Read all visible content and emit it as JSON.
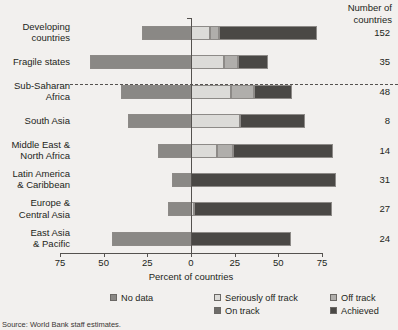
{
  "header": {
    "count_column_title_line1": "Number of",
    "count_column_title_line2": "countries"
  },
  "axis": {
    "x_title": "Percent of countries",
    "ticks": [
      {
        "label": "75",
        "value": -75
      },
      {
        "label": "50",
        "value": -50
      },
      {
        "label": "25",
        "value": -25
      },
      {
        "label": "0",
        "value": 0
      },
      {
        "label": "25",
        "value": 25
      },
      {
        "label": "50",
        "value": 50
      },
      {
        "label": "75",
        "value": 75
      }
    ]
  },
  "legend": {
    "items": [
      {
        "label": "No data",
        "color": "#8a8885"
      },
      {
        "label": "Seriously off track",
        "color": "#dcdbd8"
      },
      {
        "label": "Off track",
        "color": "#b0aeab"
      },
      {
        "label": "On track",
        "color": "#6e6c69"
      },
      {
        "label": "Achieved",
        "color": "#4a4845"
      }
    ]
  },
  "source": {
    "text": "Source: World Bank staff estimates."
  },
  "chart_data": {
    "type": "bar",
    "orientation": "horizontal",
    "stacked": true,
    "diverging": true,
    "title": "",
    "xlabel": "Percent of countries",
    "ylabel": "",
    "xlim": [
      -75,
      75
    ],
    "xticks": [
      -75,
      -50,
      -25,
      0,
      25,
      50,
      75
    ],
    "xticklabels": [
      "75",
      "50",
      "25",
      "0",
      "25",
      "50",
      "75"
    ],
    "grid": false,
    "legend_position": "bottom",
    "series_names": [
      "No data",
      "Seriously off track",
      "Off track",
      "On track",
      "Achieved"
    ],
    "series_colors": [
      "#8a8885",
      "#dcdbd8",
      "#b0aeab",
      "#6e6c69",
      "#4a4845"
    ],
    "annotations": {
      "count_column_header": "Number of countries",
      "dashed_separator_after": "Fragile states"
    },
    "categories": [
      "Developing countries",
      "Fragile states",
      "Sub-Saharan Africa",
      "South Asia",
      "Middle East & North Africa",
      "Latin America & Caribbean",
      "Europe & Central Asia",
      "East Asia & Pacific"
    ],
    "counts": [
      152,
      35,
      48,
      8,
      14,
      31,
      27,
      24
    ],
    "series": [
      {
        "name": "No data",
        "values": [
          -28,
          -58,
          -40,
          -36,
          -19,
          -11,
          -13,
          -45
        ]
      },
      {
        "name": "Seriously off track",
        "values": [
          11,
          19,
          23,
          28,
          15,
          0,
          2,
          0
        ]
      },
      {
        "name": "Off track",
        "values": [
          5,
          8,
          13,
          0,
          9,
          0,
          0,
          0
        ]
      },
      {
        "name": "On track",
        "values": [
          0,
          0,
          0,
          0,
          0,
          0,
          0,
          0
        ]
      },
      {
        "name": "Achieved",
        "values": [
          56,
          17,
          22,
          37,
          57,
          83,
          79,
          57
        ]
      }
    ]
  },
  "rows": [
    {
      "label_line1": "Developing",
      "label_line2": "countries",
      "count": "152",
      "segments": [
        {
          "series": "No data",
          "from": -28,
          "to": 0,
          "color": "#8a8885"
        },
        {
          "series": "Seriously off track",
          "from": 0,
          "to": 11,
          "color": "#dcdbd8"
        },
        {
          "series": "Off track",
          "from": 11,
          "to": 16,
          "color": "#b0aeab"
        },
        {
          "series": "Achieved",
          "from": 16,
          "to": 72,
          "color": "#4a4845"
        }
      ]
    },
    {
      "label_line1": "Fragile states",
      "label_line2": "",
      "count": "35",
      "segments": [
        {
          "series": "No data",
          "from": -58,
          "to": 0,
          "color": "#8a8885"
        },
        {
          "series": "Seriously off track",
          "from": 0,
          "to": 19,
          "color": "#dcdbd8"
        },
        {
          "series": "Off track",
          "from": 19,
          "to": 27,
          "color": "#b0aeab"
        },
        {
          "series": "Achieved",
          "from": 27,
          "to": 44,
          "color": "#4a4845"
        }
      ]
    },
    {
      "label_line1": "Sub-Saharan",
      "label_line2": "Africa",
      "count": "48",
      "segments": [
        {
          "series": "No data",
          "from": -40,
          "to": 0,
          "color": "#8a8885"
        },
        {
          "series": "Seriously off track",
          "from": 0,
          "to": 23,
          "color": "#dcdbd8"
        },
        {
          "series": "Off track",
          "from": 23,
          "to": 36,
          "color": "#b0aeab"
        },
        {
          "series": "Achieved",
          "from": 36,
          "to": 58,
          "color": "#4a4845"
        }
      ]
    },
    {
      "label_line1": "South Asia",
      "label_line2": "",
      "count": "8",
      "segments": [
        {
          "series": "No data",
          "from": -36,
          "to": 0,
          "color": "#8a8885"
        },
        {
          "series": "Seriously off track",
          "from": 0,
          "to": 28,
          "color": "#dcdbd8"
        },
        {
          "series": "Achieved",
          "from": 28,
          "to": 65,
          "color": "#4a4845"
        }
      ]
    },
    {
      "label_line1": "Middle East &",
      "label_line2": "North Africa",
      "count": "14",
      "segments": [
        {
          "series": "No data",
          "from": -19,
          "to": 0,
          "color": "#8a8885"
        },
        {
          "series": "Seriously off track",
          "from": 0,
          "to": 15,
          "color": "#dcdbd8"
        },
        {
          "series": "Off track",
          "from": 15,
          "to": 24,
          "color": "#b0aeab"
        },
        {
          "series": "Achieved",
          "from": 24,
          "to": 81,
          "color": "#4a4845"
        }
      ]
    },
    {
      "label_line1": "Latin America",
      "label_line2": "& Caribbean",
      "count": "31",
      "segments": [
        {
          "series": "No data",
          "from": -11,
          "to": 0,
          "color": "#8a8885"
        },
        {
          "series": "Achieved",
          "from": 0,
          "to": 83,
          "color": "#4a4845"
        }
      ]
    },
    {
      "label_line1": "Europe &",
      "label_line2": "Central Asia",
      "count": "27",
      "segments": [
        {
          "series": "No data",
          "from": -13,
          "to": 0,
          "color": "#8a8885"
        },
        {
          "series": "Seriously off track",
          "from": 0,
          "to": 2,
          "color": "#dcdbd8"
        },
        {
          "series": "Achieved",
          "from": 2,
          "to": 81,
          "color": "#4a4845"
        }
      ]
    },
    {
      "label_line1": "East Asia",
      "label_line2": "& Pacific",
      "count": "24",
      "segments": [
        {
          "series": "No data",
          "from": -45,
          "to": 0,
          "color": "#8a8885"
        },
        {
          "series": "Achieved",
          "from": 0,
          "to": 57,
          "color": "#4a4845"
        }
      ]
    }
  ]
}
